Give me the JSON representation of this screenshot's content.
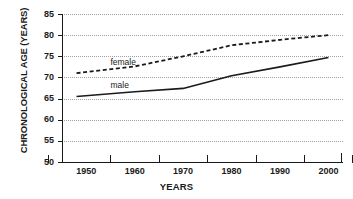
{
  "chart_data": {
    "type": "line",
    "title": "",
    "xlabel": "YEARS",
    "ylabel": "CHRONOLOGICAL AGE (YEARS)",
    "xlim": [
      1945,
      2003
    ],
    "ylim": [
      50,
      85
    ],
    "grid": true,
    "legend_position": "inline-annotation",
    "x_ticklabels": [
      "1950",
      "1960",
      "1970",
      "1980",
      "1990",
      "2000"
    ],
    "x_tickvalues": [
      1950,
      1960,
      1970,
      1980,
      1990,
      2000
    ],
    "y_ticklabels": [
      "50",
      "55",
      "60",
      "65",
      "70",
      "75",
      "80",
      "85"
    ],
    "y_tickvalues": [
      50,
      55,
      60,
      65,
      70,
      75,
      80,
      85
    ],
    "series": [
      {
        "name": "female",
        "style": "dashed",
        "color": "#1a1a1a",
        "x": [
          1948,
          1960,
          1970,
          1980,
          1990,
          2000
        ],
        "values": [
          71.0,
          72.6,
          75.0,
          77.6,
          78.9,
          80.0
        ]
      },
      {
        "name": "male",
        "style": "solid",
        "color": "#1a1a1a",
        "x": [
          1948,
          1960,
          1970,
          1980,
          1990,
          2000
        ],
        "values": [
          65.5,
          66.6,
          67.4,
          70.4,
          72.5,
          74.7
        ]
      }
    ],
    "annotations": [
      {
        "text": "female",
        "x": 1955,
        "y": 73.4
      },
      {
        "text": "male",
        "x": 1955,
        "y": 67.9
      }
    ]
  }
}
